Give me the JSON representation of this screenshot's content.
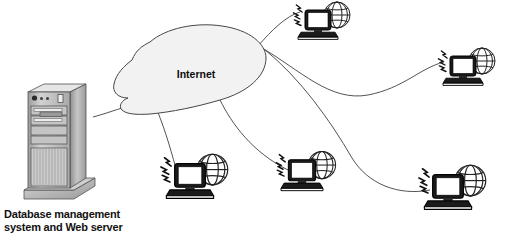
{
  "diagram": {
    "background": "#ffffff",
    "line_color": "#3a3a3a",
    "cloud": {
      "label": "Internet",
      "fill": "#f2f2f2",
      "stroke": "#444444",
      "label_x": 196,
      "label_y": 74
    },
    "server": {
      "caption_line1": "Database management",
      "caption_line2": "system and Web server",
      "body_color": "#b5b5b5",
      "face_color": "#c9c9c9",
      "top_color": "#e2e2e2",
      "stroke": "#4a4a4a",
      "x": 25,
      "y": 85,
      "width": 70,
      "height": 115
    },
    "nodes": [
      {
        "id": "client-top-right",
        "name": "wireless-client-1",
        "x": 318,
        "y": 34,
        "scale": 1.0
      },
      {
        "id": "client-right-middle",
        "name": "wireless-client-2",
        "x": 463,
        "y": 80,
        "scale": 1.0
      },
      {
        "id": "client-bottom-left",
        "name": "wireless-client-3",
        "x": 190,
        "y": 192,
        "scale": 1.18
      },
      {
        "id": "client-bottom-mid",
        "name": "wireless-client-4",
        "x": 302,
        "y": 185,
        "scale": 1.05
      },
      {
        "id": "client-bottom-right",
        "name": "wireless-client-5",
        "x": 448,
        "y": 203,
        "scale": 1.18
      }
    ],
    "links": [
      {
        "from": "server",
        "to": "cloud",
        "name": "link-server-to-internet"
      },
      {
        "from": "cloud",
        "to": "client-top-right",
        "name": "link-internet-to-client-1"
      },
      {
        "from": "cloud",
        "to": "client-right-middle",
        "name": "link-internet-to-client-2"
      },
      {
        "from": "cloud",
        "to": "client-bottom-left",
        "name": "link-internet-to-client-3"
      },
      {
        "from": "cloud",
        "to": "client-bottom-mid",
        "name": "link-internet-to-client-4"
      },
      {
        "from": "cloud",
        "to": "client-bottom-right",
        "name": "link-internet-to-client-5"
      }
    ],
    "icons": {
      "cloud": "cloud-icon",
      "server": "server-tower-icon",
      "laptop": "laptop-icon",
      "globe": "globe-icon",
      "signal": "wireless-signal-icon"
    }
  }
}
